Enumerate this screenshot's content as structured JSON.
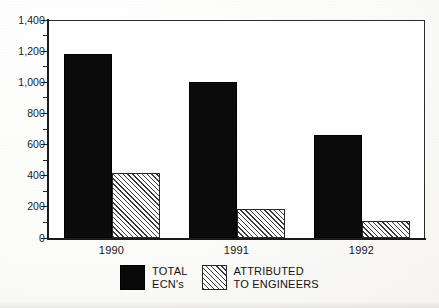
{
  "chart_data": {
    "type": "bar",
    "title": "",
    "xlabel": "",
    "ylabel": "",
    "categories": [
      "1990",
      "1991",
      "1992"
    ],
    "series": [
      {
        "name": "TOTAL ECN's",
        "values": [
          1180,
          1000,
          660
        ]
      },
      {
        "name": "ATTRIBUTED TO ENGINEERS",
        "values": [
          415,
          185,
          110
        ]
      }
    ],
    "ylim": [
      0,
      1400
    ],
    "ytick_labels": [
      "0",
      "200",
      "400",
      "600",
      "800",
      "1,000",
      "1,200",
      "1,400"
    ],
    "ytick_values": [
      0,
      200,
      400,
      600,
      800,
      1000,
      1200,
      1400
    ],
    "yminor_step": 100,
    "grid": false,
    "legend_position": "bottom"
  },
  "legend": {
    "items": [
      {
        "swatch": "solid-black-swatch",
        "line1": "TOTAL",
        "line2": "ECN's"
      },
      {
        "swatch": "hatched-swatch",
        "line1": "ATTRIBUTED",
        "line2": "TO ENGINEERS"
      }
    ]
  },
  "colors": {
    "series_total": "#0b0b0b",
    "series_attributed_line": "#3a3a3a",
    "series_attributed_fill": "#ffffff",
    "axis": "#1b1b1b",
    "frame": "#2c2c2c",
    "page": "#fdfdfb"
  }
}
